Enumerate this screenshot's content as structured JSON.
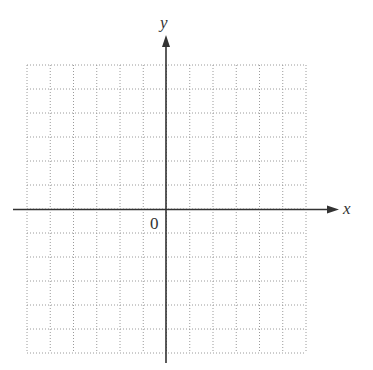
{
  "diagram": {
    "type": "cartesian-coordinate-grid",
    "x_axis_label": "x",
    "y_axis_label": "y",
    "origin_label": "0",
    "grid": {
      "columns": 12,
      "rows": 12,
      "columns_left_of_y_axis": 6,
      "rows_above_x_axis": 6,
      "line_style": "dotted"
    },
    "colors": {
      "axis": "#333333",
      "grid": "#9a9a9a",
      "background": "#ffffff",
      "text": "#333333"
    }
  }
}
